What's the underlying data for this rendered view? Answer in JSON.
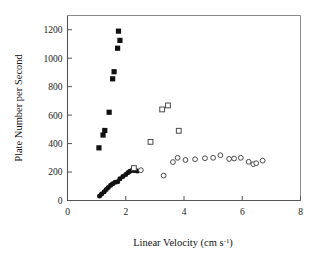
{
  "chart_data": {
    "type": "scatter",
    "title": "",
    "xlabel": "Linear Velocity (cm s",
    "xlabel_sup": "-1",
    "xlabel_tail": ")",
    "ylabel": "Plate Number per Second",
    "xlim": [
      0,
      8
    ],
    "ylim": [
      0,
      1300
    ],
    "xticks": [
      0,
      2,
      4,
      6,
      8
    ],
    "xticklabels": [
      "0",
      "2",
      "4",
      "6",
      "8"
    ],
    "yticks": [
      0,
      200,
      400,
      600,
      800,
      1000,
      1200
    ],
    "yticklabels": [
      "0",
      "200",
      "400",
      "600",
      "800",
      "1000",
      "1200"
    ],
    "grid": false,
    "legend": "none",
    "series": [
      {
        "name": "filled-squares-upper-branch",
        "marker": "filled-square",
        "color": "#111111",
        "points": [
          [
            1.08,
            370
          ],
          [
            1.22,
            460
          ],
          [
            1.28,
            492
          ],
          [
            1.43,
            620
          ],
          [
            1.55,
            855
          ],
          [
            1.6,
            905
          ],
          [
            1.72,
            1070
          ],
          [
            1.75,
            1190
          ],
          [
            1.8,
            1125
          ]
        ]
      },
      {
        "name": "filled-circles-lower-branch",
        "marker": "filled-circle",
        "color": "#111111",
        "points": [
          [
            1.1,
            32
          ],
          [
            1.17,
            45
          ],
          [
            1.26,
            62
          ],
          [
            1.33,
            78
          ],
          [
            1.4,
            92
          ],
          [
            1.48,
            108
          ],
          [
            1.55,
            118
          ],
          [
            1.63,
            128
          ],
          [
            1.72,
            132
          ],
          [
            1.8,
            152
          ],
          [
            1.9,
            168
          ],
          [
            2.0,
            182
          ],
          [
            2.08,
            196
          ],
          [
            2.14,
            205
          ],
          [
            2.22,
            212
          ],
          [
            2.3,
            210
          ],
          [
            2.4,
            208
          ]
        ]
      },
      {
        "name": "open-squares-upper-branch",
        "marker": "open-square",
        "color": "#4a4a4a",
        "points": [
          [
            2.28,
            228
          ],
          [
            2.85,
            412
          ],
          [
            3.25,
            640
          ],
          [
            3.45,
            668
          ],
          [
            3.82,
            490
          ]
        ]
      },
      {
        "name": "open-circles-plateau",
        "marker": "open-circle",
        "color": "#4a4a4a",
        "points": [
          [
            2.52,
            213
          ],
          [
            3.3,
            175
          ],
          [
            3.62,
            270
          ],
          [
            3.78,
            300
          ],
          [
            4.05,
            285
          ],
          [
            4.38,
            290
          ],
          [
            4.72,
            297
          ],
          [
            5.0,
            300
          ],
          [
            5.25,
            318
          ],
          [
            5.55,
            292
          ],
          [
            5.72,
            295
          ],
          [
            5.95,
            300
          ],
          [
            6.22,
            272
          ],
          [
            6.38,
            255
          ],
          [
            6.48,
            262
          ],
          [
            6.7,
            280
          ]
        ]
      }
    ]
  }
}
